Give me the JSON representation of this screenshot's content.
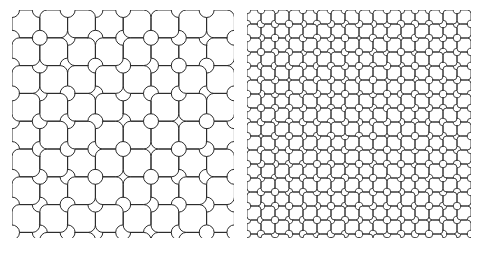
{
  "figure": {
    "background_color": "#ffffff",
    "width": 482,
    "height": 256,
    "panel_count": 2
  },
  "style": {
    "stroke_color": "#2b2b2b",
    "stroke_width_left": 1.0,
    "stroke_width_right": 1.0,
    "fill": "none",
    "line_cap": "round",
    "line_join": "round"
  },
  "panels": [
    {
      "id": "panel-left",
      "name": "coarse-scale-tiling",
      "label": "Left panel — coarse scale",
      "x": 12,
      "y": 10,
      "width": 222,
      "height": 228,
      "columns": 8,
      "rows": 8,
      "tile_pitch": 27.8,
      "tile_size": 27.8,
      "corner_arc_radius_ratio": 0.27,
      "waist_ratio": 0.3,
      "stroke_width": 1.0,
      "stroke_color": "#2b2b2b",
      "scale_level": 1
    },
    {
      "id": "panel-right",
      "name": "fine-scale-tiling",
      "label": "Right panel — fine scale",
      "x": 247,
      "y": 10,
      "width": 224,
      "height": 228,
      "columns": 16,
      "rows": 16,
      "tile_pitch": 14.0,
      "tile_size": 14.0,
      "corner_arc_radius_ratio": 0.27,
      "waist_ratio": 0.3,
      "stroke_width": 0.9,
      "stroke_color": "#2b2b2b",
      "scale_level": 2
    }
  ],
  "tile": {
    "name": "dog-bone-cross-tile",
    "description": "Unit square with concave quarter-circle arcs removed from each corner, producing a four-lobed cross outline that interlocks with neighbours.",
    "symmetry": "C4 rotational",
    "orientation_states": 4
  },
  "chart_data": {
    "type": "diagram",
    "series": [
      {
        "name": "coarse-scale-tiling",
        "columns": 8,
        "rows": 16,
        "tile_pitch": 27.8,
        "tile_count": 128
      },
      {
        "name": "fine-scale-tiling",
        "columns": 16,
        "rows": 16,
        "tile_pitch": 14.0,
        "tile_count": 256
      }
    ],
    "xlabel": "",
    "ylabel": "",
    "grid": false,
    "legend": "none"
  }
}
